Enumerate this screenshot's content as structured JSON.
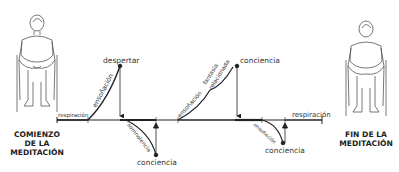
{
  "diagram": {
    "start_caption": [
      "COMIENZO",
      "DE LA",
      "MEDITACIÓN"
    ],
    "end_caption": [
      "FIN DE LA",
      "MEDITACIÓN"
    ],
    "labels": {
      "respiracion_start": "respiración",
      "ensonacion_1": "ensoñación",
      "despertar": "despertar",
      "somnolencia": "somnolencia",
      "conciencia_1": "conciencia",
      "ensonacion_2": "ensoñación",
      "fantasia": "fantasía",
      "relacionada": "relacionada",
      "conciencia_2": "conciencia",
      "ensonacion_3": "ensoñación",
      "conciencia_3": "conciencia",
      "respiracion_end": "respiración"
    },
    "colors": {
      "line": "#222222",
      "text": "#333333",
      "figure": "#555555"
    }
  }
}
